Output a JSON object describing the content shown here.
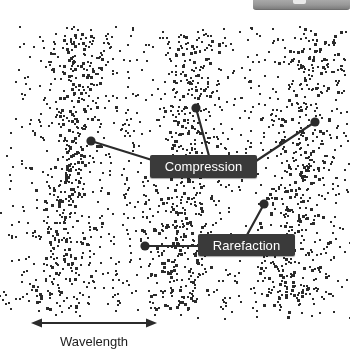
{
  "figure": {
    "type": "longitudinal-wave-diagram",
    "background_color": "#ffffff",
    "dot_color": "#2b2b2b",
    "callout_fill": "#3a3a3a",
    "callout_text_color": "#ffffff",
    "line_color": "#2b2b2b"
  },
  "callouts": [
    {
      "id": "compression",
      "label": "Compression",
      "box": {
        "x": 150,
        "y": 155,
        "w": 107,
        "h": 23
      },
      "leaders": [
        {
          "from": {
            "x": 91,
            "y": 141
          },
          "to": {
            "x": 152,
            "y": 160
          },
          "dot": true
        },
        {
          "from": {
            "x": 196,
            "y": 108
          },
          "to": {
            "x": 209,
            "y": 156
          },
          "dot": true
        },
        {
          "from": {
            "x": 315,
            "y": 122
          },
          "to": {
            "x": 256,
            "y": 161
          },
          "dot": true
        }
      ]
    },
    {
      "id": "rarefaction",
      "label": "Rarefaction",
      "box": {
        "x": 198,
        "y": 234,
        "w": 97,
        "h": 22
      },
      "leaders": [
        {
          "from": {
            "x": 145,
            "y": 246
          },
          "to": {
            "x": 199,
            "y": 246
          },
          "dot": true
        },
        {
          "from": {
            "x": 264,
            "y": 204
          },
          "to": {
            "x": 247,
            "y": 235
          },
          "dot": true
        }
      ]
    }
  ],
  "measurement": {
    "label": "Wavelength",
    "arrow": {
      "x1": 31,
      "x2": 157,
      "y": 323,
      "double_headed": true
    }
  },
  "bands": [
    {
      "id": "band-left",
      "center_x": 68,
      "lean": 26,
      "width": 52,
      "dots": 560
    },
    {
      "id": "band-middle",
      "center_x": 183,
      "lean": 26,
      "width": 52,
      "dots": 560
    },
    {
      "id": "band-right",
      "center_x": 298,
      "lean": 26,
      "width": 52,
      "dots": 560
    }
  ],
  "top_artifact": {
    "present": true,
    "description": "cropped gray toolbar fragment"
  }
}
